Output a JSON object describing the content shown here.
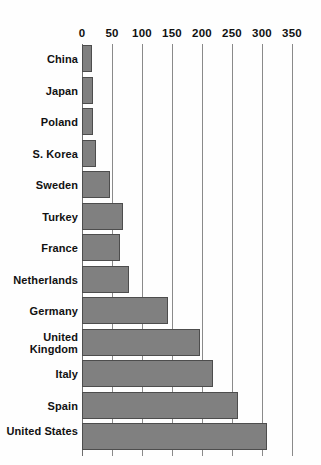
{
  "chart_data": {
    "type": "bar",
    "orientation": "horizontal",
    "title": "",
    "subtitle": "",
    "xlabel": "",
    "ylabel": "",
    "xlim": [
      0,
      350
    ],
    "grid": true,
    "legend": false,
    "axis_position": "top",
    "xticks": [
      0,
      50,
      100,
      150,
      200,
      250,
      300,
      350
    ],
    "xtick_labels": [
      "0",
      "50",
      "100",
      "150",
      "200",
      "250",
      "300",
      "350"
    ],
    "categories": [
      "China",
      "Japan",
      "Poland",
      "S. Korea",
      "Sweden",
      "Turkey",
      "France",
      "Netherlands",
      "Germany",
      "United Kingdom",
      "Italy",
      "Spain",
      "United States"
    ],
    "values": [
      16,
      18,
      19,
      24,
      47,
      68,
      64,
      78,
      143,
      197,
      218,
      260,
      308
    ],
    "bar_color": "#808080",
    "bar_edge_color": "#4d4d4d",
    "gridline_color": "#8a8a8a",
    "background_color": "#fefefe",
    "text_color": "#111111"
  }
}
